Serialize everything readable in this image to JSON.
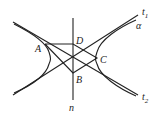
{
  "diagram": {
    "type": "geometry-hyperbola",
    "colors": {
      "stroke": "#222222",
      "background": "#ffffff"
    },
    "labels": {
      "A": "A",
      "B": "B",
      "C": "C",
      "D": "D",
      "n": "n",
      "alpha": "α",
      "t1_main": "t",
      "t1_sub": "1",
      "t2_main": "t",
      "t2_sub": "2"
    },
    "points": {
      "A": [
        45,
        44
      ],
      "B": [
        73,
        73
      ],
      "C": [
        97,
        58
      ],
      "D": [
        73,
        44
      ],
      "center": [
        73,
        58
      ]
    },
    "lines": {
      "n": {
        "from": [
          73,
          18
        ],
        "to": [
          73,
          100
        ]
      },
      "t1": {
        "from": [
          13,
          95
        ],
        "to": [
          138,
          15
        ]
      },
      "t2": {
        "from": [
          13,
          22
        ],
        "to": [
          138,
          95
        ]
      }
    }
  }
}
